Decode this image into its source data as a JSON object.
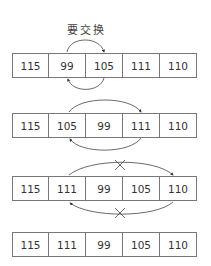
{
  "label": "要交换",
  "rows": [
    {
      "values": [
        "115",
        "99",
        "105",
        "111",
        "110"
      ]
    },
    {
      "values": [
        "115",
        "105",
        "99",
        "111",
        "110"
      ]
    },
    {
      "values": [
        "115",
        "111",
        "99",
        "105",
        "110"
      ]
    },
    {
      "values": [
        "115",
        "111",
        "99",
        "105",
        "110"
      ]
    }
  ],
  "arrows": [
    {
      "row": 1,
      "from_index": 1,
      "to_index": 2,
      "crossed": false
    },
    {
      "row": 2,
      "from_index": 1,
      "to_index": 3,
      "crossed": false
    },
    {
      "row": 3,
      "from_index": 1,
      "to_index": 4,
      "crossed": true
    }
  ]
}
